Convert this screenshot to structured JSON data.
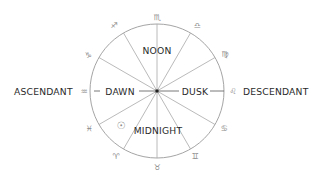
{
  "diagram": {
    "center": {
      "x": 157,
      "y": 91
    },
    "radius": 67,
    "colors": {
      "ring": "#9a9a9a",
      "spokes": "#a8a8a8",
      "text": "#2a2a2a",
      "glyphs": "#8a8a8a",
      "center_dot": "#222222"
    },
    "labels": {
      "ascendant": "ASCENDANT",
      "descendant": "DESCENDANT",
      "noon": "NOON",
      "midnight": "MIDNIGHT",
      "dawn": "DAWN",
      "dusk": "DUSK"
    },
    "zodiac_glyphs": {
      "scorpio": "♏",
      "libra": "♎",
      "virgo": "♍",
      "leo": "♌",
      "cancer": "♋",
      "gemini": "♊",
      "taurus": "♉",
      "aries": "♈",
      "pisces": "♓",
      "aquarius": "♒",
      "capricorn": "♑",
      "sagittarius": "♐"
    },
    "sun_symbol": "☉"
  }
}
